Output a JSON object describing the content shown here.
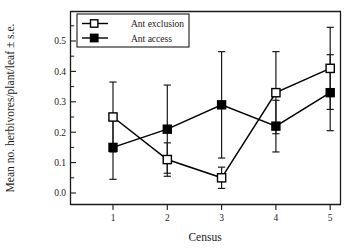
{
  "chart_data": {
    "type": "line",
    "title": "",
    "xlabel": "Census",
    "ylabel": "Mean no. herbivores/plant/leaf ± s.e.",
    "x": [
      1,
      2,
      3,
      4,
      5
    ],
    "xticklabels": [
      "1",
      "2",
      "3",
      "4",
      "5"
    ],
    "yticklabels": [
      "0.0",
      "0.1",
      "0.2",
      "0.3",
      "0.4",
      "0.5"
    ],
    "ytickvalues": [
      0.0,
      0.1,
      0.2,
      0.3,
      0.4,
      0.5
    ],
    "ylim": [
      -0.035,
      0.575
    ],
    "xlim": [
      0.52,
      5.5
    ],
    "grid": false,
    "legend_position": "top-left",
    "series": [
      {
        "name": "Ant exclusion",
        "marker": "open-square",
        "values": [
          0.25,
          0.11,
          0.05,
          0.33,
          0.41
        ],
        "errors": [
          0.115,
          0.055,
          0.035,
          0.135,
          0.135
        ]
      },
      {
        "name": "Ant access",
        "marker": "filled-square",
        "values": [
          0.15,
          0.21,
          0.29,
          0.22,
          0.33
        ]
      }
    ],
    "series_errors_note": "",
    "errors_access": [
      0.105,
      0.145,
      0.175,
      0.085,
      0.125
    ]
  },
  "legend": {
    "entries": [
      {
        "label": "Ant exclusion",
        "marker": "open-square"
      },
      {
        "label": "Ant access",
        "marker": "filled-square"
      }
    ]
  },
  "colors": {
    "axis": "#1a1a1a",
    "series_line": "#000000",
    "marker_open_fill": "#ffffff",
    "marker_filled_fill": "#000000",
    "background": "#ffffff"
  }
}
